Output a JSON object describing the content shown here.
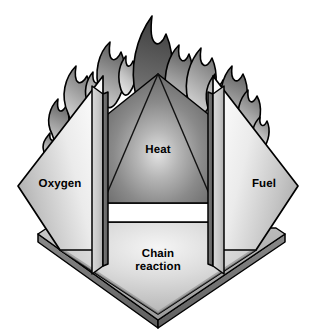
{
  "figure": {
    "background_color": "#ffffff",
    "outline_color": "#000000"
  },
  "faces": {
    "oxygen": {
      "label": "Oxygen",
      "name": "oxygen-face",
      "fill_light": "#f2f2f2",
      "fill_dark": "#9a9a9a"
    },
    "fuel": {
      "label": "Fuel",
      "name": "fuel-face",
      "fill_light": "#f2f2f2",
      "fill_dark": "#9a9a9a"
    },
    "heat": {
      "label": "Heat",
      "name": "heat-face",
      "fill_light": "#d8d8d8",
      "fill_dark": "#6e6e6e"
    },
    "chain_reaction": {
      "label": "Chain\nreaction",
      "name": "chain-reaction-face",
      "fill_light": "#efefef",
      "fill_dark": "#a6a6a6"
    }
  },
  "structure": {
    "base_plate": {
      "name": "base-plate",
      "top_fill": "#b4b4b4",
      "edge_fill": "#6f6f6f"
    },
    "left_post": {
      "name": "left-support-post",
      "fill": "#c9c9c9",
      "shadow_fill": "#6a6a6a"
    },
    "right_post": {
      "name": "right-support-post",
      "fill": "#c9c9c9",
      "shadow_fill": "#6a6a6a"
    },
    "gap_band": {
      "name": "white-gap-band",
      "fill": "#ffffff"
    }
  },
  "flames": {
    "name": "flame-cluster",
    "fill_light": "#cfcfcf",
    "fill_mid": "#9c9c9c",
    "fill_dark": "#4a4a4a",
    "outline": "#000000",
    "count": 13
  }
}
